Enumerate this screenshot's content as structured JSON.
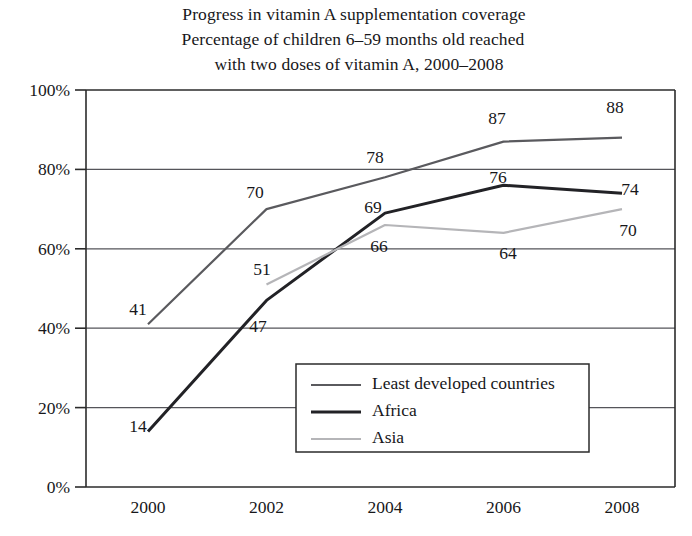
{
  "chart_data": {
    "type": "line",
    "title": "Progress in vitamin A supplementation coverage",
    "subtitle_line1": "Percentage of children 6–59 months old reached",
    "subtitle_line2": "with two doses of vitamin A, 2000–2008",
    "xlabel": "",
    "ylabel": "",
    "x": [
      2000,
      2002,
      2004,
      2006,
      2008
    ],
    "categories": [
      "2000",
      "2002",
      "2004",
      "2006",
      "2008"
    ],
    "xtick_labels": [
      "2000",
      "2002",
      "2004",
      "2006",
      "2008"
    ],
    "ytick_labels": [
      "0%",
      "20%",
      "40%",
      "60%",
      "80%",
      "100%"
    ],
    "ytick_values": [
      0,
      20,
      40,
      60,
      80,
      100
    ],
    "ylim": [
      0,
      100
    ],
    "xlim": [
      2000,
      2008
    ],
    "grid": true,
    "legend_position": "inside-lower-center",
    "series": [
      {
        "name": "Least developed countries",
        "color": "#5a5a5e",
        "width": 2.2,
        "x": [
          2000,
          2002,
          2004,
          2006,
          2008
        ],
        "values": [
          41,
          70,
          78,
          87,
          88
        ],
        "labels": [
          "41",
          "70",
          "78",
          "87",
          "88"
        ]
      },
      {
        "name": "Africa",
        "color": "#222226",
        "width": 3.0,
        "x": [
          2000,
          2002,
          2004,
          2006,
          2008
        ],
        "values": [
          14,
          47,
          69,
          76,
          74
        ],
        "labels": [
          "14",
          "47",
          "69",
          "76",
          "74"
        ]
      },
      {
        "name": "Asia",
        "color": "#b5b5b8",
        "width": 2.2,
        "x": [
          2002,
          2004,
          2006,
          2008
        ],
        "values": [
          51,
          66,
          64,
          70
        ],
        "labels": [
          "51",
          "66",
          "64",
          "70"
        ]
      }
    ],
    "annotations": [
      {
        "text": "41",
        "series": "Least developed countries",
        "x": 2000,
        "value": 41,
        "px": 138,
        "py": 315
      },
      {
        "text": "70",
        "series": "Least developed countries",
        "x": 2002,
        "value": 70,
        "px": 255,
        "py": 198
      },
      {
        "text": "78",
        "series": "Least developed countries",
        "x": 2004,
        "value": 78,
        "px": 375,
        "py": 163
      },
      {
        "text": "87",
        "series": "Least developed countries",
        "x": 2006,
        "value": 87,
        "px": 497,
        "py": 124
      },
      {
        "text": "88",
        "series": "Least developed countries",
        "x": 2008,
        "value": 88,
        "px": 615,
        "py": 113
      },
      {
        "text": "14",
        "series": "Africa",
        "x": 2000,
        "value": 14,
        "px": 138,
        "py": 432
      },
      {
        "text": "47",
        "series": "Africa",
        "x": 2002,
        "value": 47,
        "px": 258,
        "py": 332
      },
      {
        "text": "69",
        "series": "Africa",
        "x": 2004,
        "value": 69,
        "px": 373,
        "py": 213
      },
      {
        "text": "76",
        "series": "Africa",
        "x": 2006,
        "value": 76,
        "px": 498,
        "py": 183
      },
      {
        "text": "74",
        "series": "Africa",
        "x": 2008,
        "value": 74,
        "px": 630,
        "py": 195
      },
      {
        "text": "51",
        "series": "Asia",
        "x": 2002,
        "value": 51,
        "px": 262,
        "py": 275
      },
      {
        "text": "66",
        "series": "Asia",
        "x": 2004,
        "value": 66,
        "px": 379,
        "py": 252
      },
      {
        "text": "64",
        "series": "Asia",
        "x": 2006,
        "value": 64,
        "px": 508,
        "py": 259
      },
      {
        "text": "70",
        "series": "Asia",
        "x": 2008,
        "value": 70,
        "px": 628,
        "py": 236
      }
    ]
  },
  "legend": {
    "items": [
      {
        "label": "Least developed countries",
        "color": "#5a5a5e",
        "width": 2.2
      },
      {
        "label": "Africa",
        "color": "#222226",
        "width": 3.0
      },
      {
        "label": "Asia",
        "color": "#b5b5b8",
        "width": 2.2
      }
    ]
  },
  "colors": {
    "axis": "#2b2b2b",
    "grid": "#55555a",
    "text": "#17171a",
    "background": "#ffffff"
  }
}
